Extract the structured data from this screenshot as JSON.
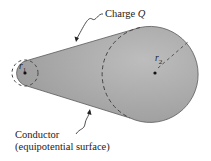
{
  "diagram": {
    "charge_label_prefix": "Charge ",
    "charge_symbol": "Q",
    "r1_label": "r",
    "r1_sub": "1",
    "r2_label": "r",
    "r2_sub": "2",
    "conductor_label": "Conductor",
    "conductor_sublabel": "(equipotential surface)",
    "colors": {
      "fill": "#a8a8a8",
      "edge": "#555555",
      "dash": "#4a4a4a"
    }
  }
}
